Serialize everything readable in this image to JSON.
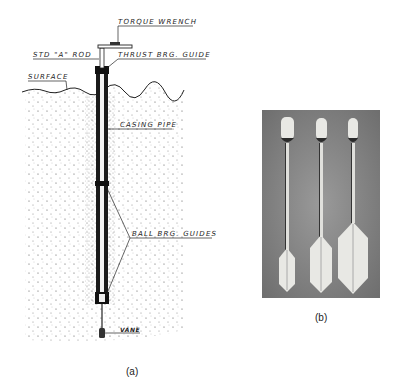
{
  "figure_a": {
    "caption": "(a)",
    "labels": {
      "torque_wrench": "TORQUE WRENCH",
      "std_a_rod": "STD \"A\" ROD",
      "thrust_brg_guide": "THRUST BRG. GUIDE",
      "surface": "SURFACE",
      "casing_pipe": "CASING PIPE",
      "ball_brg_guides": "BALL BRG. GUIDES",
      "vane": "VANE"
    }
  },
  "figure_b": {
    "caption": "(b)",
    "description": "Photograph of three vane shear devices with increasing vane sizes"
  },
  "colors": {
    "ink": "#222222",
    "photo_background": "#8a8a8a",
    "vane_white": "#e8e8e4"
  }
}
